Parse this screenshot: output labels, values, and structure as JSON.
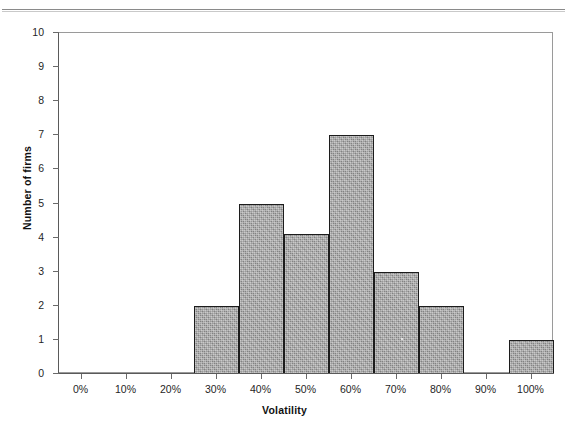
{
  "page": {
    "header_text": "VOLATILITY OF FIRM VALUE",
    "header_rule": "horizontal-rule"
  },
  "chart_data": {
    "type": "bar",
    "title": "",
    "subtitle": "",
    "xlabel": "Volatility",
    "ylabel": "Number of firms",
    "categories": [
      "0%",
      "10%",
      "20%",
      "30%",
      "40%",
      "50%",
      "60%",
      "70%",
      "80%",
      "90%",
      "100%"
    ],
    "values": [
      0,
      0,
      0,
      2,
      5,
      4.1,
      7,
      3,
      2,
      0,
      1
    ],
    "xlim": [
      -5,
      105
    ],
    "ylim": [
      0,
      10
    ],
    "xtick_labels": [
      "0%",
      "10%",
      "20%",
      "30%",
      "40%",
      "50%",
      "60%",
      "70%",
      "80%",
      "90%",
      "100%"
    ],
    "xtick_values": [
      0,
      10,
      20,
      30,
      40,
      50,
      60,
      70,
      80,
      90,
      100
    ],
    "ytick_labels": [
      "0",
      "1",
      "2",
      "3",
      "4",
      "5",
      "6",
      "7",
      "8",
      "9",
      "10"
    ],
    "ytick_values": [
      0,
      1,
      2,
      3,
      4,
      5,
      6,
      7,
      8,
      9,
      10
    ],
    "grid": false,
    "legend": false,
    "legend_position": "none",
    "bar_fill_color": "#a6a6a6",
    "bar_edge_color": "#1c1c1c",
    "plot_frame_color": "#9a9a9a",
    "background_color": "#ffffff",
    "bar_width_percent": 10,
    "annotations": []
  }
}
